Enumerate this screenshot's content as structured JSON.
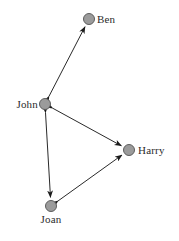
{
  "diagram": {
    "type": "social-network-graph",
    "title": "",
    "background_color": "#ffffff",
    "width": 179,
    "height": 241,
    "node_style": {
      "fill_color": "#9b9b9b",
      "stroke_color": "#5d5d5d",
      "radius": 5.5,
      "stroke_width": 1
    },
    "edge_style": {
      "color": "#2a2a2a",
      "width": 1,
      "arrowhead": "double",
      "arrowhead_color": "#1a1a1a"
    },
    "nodes": [
      {
        "id": "ben",
        "label": "Ben",
        "x": 89,
        "y": 19,
        "label_x": 97,
        "label_y": 19,
        "label_position": "right"
      },
      {
        "id": "john",
        "label": "John",
        "x": 45,
        "y": 104,
        "label_x": 38,
        "label_y": 104,
        "label_position": "left"
      },
      {
        "id": "harry",
        "label": "Harry",
        "x": 129,
        "y": 150,
        "label_x": 138,
        "label_y": 150,
        "label_position": "right"
      },
      {
        "id": "joan",
        "label": "Joan",
        "x": 51,
        "y": 206,
        "label_x": 51,
        "label_y": 214,
        "label_position": "below"
      }
    ],
    "edges": [
      {
        "id": "edge-john-ben",
        "source": "john",
        "target": "ben",
        "directed": "both"
      },
      {
        "id": "edge-john-harry",
        "source": "john",
        "target": "harry",
        "directed": "both"
      },
      {
        "id": "edge-john-joan",
        "source": "john",
        "target": "joan",
        "directed": "both"
      },
      {
        "id": "edge-joan-harry",
        "source": "joan",
        "target": "harry",
        "directed": "both"
      }
    ]
  }
}
